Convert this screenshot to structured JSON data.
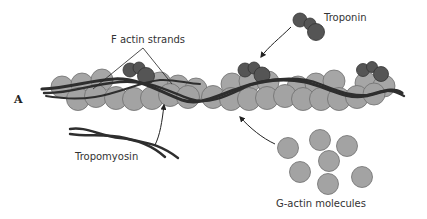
{
  "figure": {
    "panel_label": "A",
    "labels": {
      "f_actin": "F actin strands",
      "troponin": "Troponin",
      "tropomyosin": "Tropomyosin",
      "g_actin": "G-actin molecules"
    },
    "colors": {
      "g_actin": "#a3a3a3",
      "g_actin_stroke": "#6e6e6e",
      "troponin": "#555555",
      "troponin_stroke": "#3a3a3a",
      "tropomyosin": "#2e2e2e",
      "text": "#333333",
      "background": "#ffffff"
    }
  }
}
